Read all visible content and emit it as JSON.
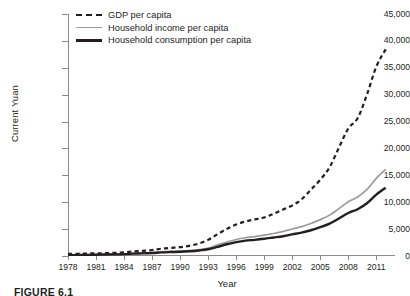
{
  "chart_data": {
    "type": "line",
    "title": "",
    "xlabel": "Year",
    "ylabel": "Current Yuan",
    "xlim": [
      1978,
      2013
    ],
    "ylim": [
      0,
      45000
    ],
    "ytick_labels": [
      "0",
      "5,000",
      "10,000",
      "15,000",
      "20,000",
      "25,000",
      "30,000",
      "35,000",
      "40,000",
      "45,000"
    ],
    "ytick_values": [
      0,
      5000,
      10000,
      15000,
      20000,
      25000,
      30000,
      35000,
      40000,
      45000
    ],
    "xtick_labels": [
      "1978",
      "1981",
      "1984",
      "1987",
      "1990",
      "1993",
      "1996",
      "1999",
      "2002",
      "2005",
      "2008",
      "2011"
    ],
    "xtick_values": [
      1978,
      1981,
      1984,
      1987,
      1990,
      1993,
      1996,
      1999,
      2002,
      2005,
      2008,
      2011
    ],
    "grid": false,
    "legend_position": "top-left",
    "x": [
      1978,
      1979,
      1980,
      1981,
      1982,
      1983,
      1984,
      1985,
      1986,
      1987,
      1988,
      1989,
      1990,
      1991,
      1992,
      1993,
      1994,
      1995,
      1996,
      1997,
      1998,
      1999,
      2000,
      2001,
      2002,
      2003,
      2004,
      2005,
      2006,
      2007,
      2008,
      2009,
      2010,
      2011,
      2012
    ],
    "series": [
      {
        "name": "GDP per capita",
        "style": "dashed",
        "color": "#231f20",
        "values": [
          385,
          423,
          468,
          497,
          533,
          588,
          695,
          858,
          963,
          1112,
          1366,
          1519,
          1644,
          1893,
          2311,
          2998,
          4044,
          5046,
          5846,
          6420,
          6796,
          7159,
          7858,
          8622,
          9398,
          10542,
          12336,
          14185,
          16500,
          20169,
          23708,
          25608,
          30015,
          35198,
          38420
        ]
      },
      {
        "name": "Household income per capita",
        "style": "solid",
        "color": "#9b9b9e",
        "values": [
          171,
          197,
          236,
          268,
          304,
          343,
          405,
          498,
          567,
          637,
          784,
          863,
          904,
          1014,
          1186,
          1479,
          2077,
          2599,
          3068,
          3400,
          3600,
          3870,
          4190,
          4560,
          5030,
          5450,
          6040,
          6760,
          7600,
          8810,
          10080,
          10980,
          12400,
          14430,
          16100
        ]
      },
      {
        "name": "Household consumption per capita",
        "style": "solid",
        "color": "#231f20",
        "values": [
          151,
          174,
          207,
          233,
          265,
          298,
          351,
          437,
          495,
          548,
          672,
          733,
          779,
          878,
          1025,
          1255,
          1700,
          2180,
          2580,
          2860,
          3000,
          3200,
          3440,
          3680,
          4020,
          4340,
          4790,
          5360,
          6030,
          6980,
          7990,
          8700,
          9800,
          11400,
          12700
        ]
      }
    ]
  },
  "legend": {
    "items": [
      {
        "label": "GDP per capita",
        "swatch": "sw-dash"
      },
      {
        "label": "Household income per capita",
        "swatch": "sw-gray"
      },
      {
        "label": "Household consumption per capita",
        "swatch": "sw-black"
      }
    ]
  },
  "caption": {
    "text": "FIGURE 6.1"
  }
}
